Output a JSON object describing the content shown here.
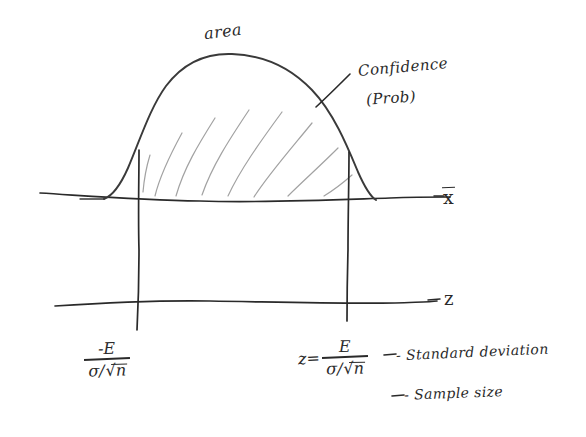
{
  "diagram": {
    "title_label": "area",
    "annotations": {
      "confidence": "Confidence",
      "probability": "(Prob)"
    },
    "axes": {
      "upper_axis_label": "x",
      "upper_axis_label_kind": "x-bar",
      "lower_axis_label": "z"
    },
    "formula_left": {
      "numerator": "-E",
      "denominator_sigma": "σ",
      "denominator_slash": "/",
      "denominator_root": "√",
      "denominator_n": "n"
    },
    "formula_right": {
      "lead": "z=",
      "numerator": "E",
      "denominator_sigma": "σ",
      "denominator_slash": "/",
      "denominator_root": "√",
      "denominator_n": "n"
    },
    "legend": {
      "sigma_meaning": "- Standard deviation",
      "n_meaning": "- Sample size"
    },
    "colors": {
      "ink": "#2a2a2a",
      "hatch": "#9a9a9a",
      "paper": "#ffffff"
    }
  }
}
